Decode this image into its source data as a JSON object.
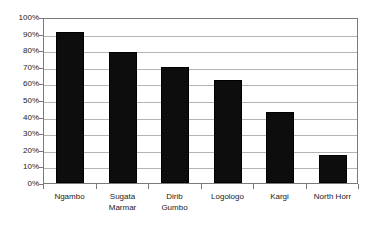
{
  "chart_data": {
    "type": "bar",
    "title": "",
    "subtitle": "",
    "xlabel": "",
    "ylabel": "",
    "ylim": [
      0,
      100
    ],
    "yunit": "%",
    "grid": true,
    "legend": false,
    "legend_position": "none",
    "orientation": "vertical",
    "bar_color": "#0d0d0d",
    "gridline_color": "#b4b4b4",
    "frame_color": "#7a7a7a",
    "background_color": "#ffffff",
    "categories": [
      "Ngambo",
      "Sugata Marmar",
      "Dirib Gumbo",
      "Logologo",
      "Kargi",
      "North Horr"
    ],
    "category_lines": [
      [
        "Ngambo"
      ],
      [
        "Sugata",
        "Marmar"
      ],
      [
        "Dirib",
        "Gumbo"
      ],
      [
        "Logologo"
      ],
      [
        "Kargi"
      ],
      [
        "North Horr"
      ]
    ],
    "values": [
      91,
      79,
      70,
      62,
      43,
      17
    ],
    "value_labels": [
      "91%",
      "79%",
      "70%",
      "62%",
      "43%",
      "17%"
    ],
    "ytick_values": [
      100,
      90,
      80,
      70,
      60,
      50,
      40,
      30,
      20,
      10,
      0
    ],
    "ytick_labels": [
      "100%",
      "90%",
      "80%",
      "70%",
      "60%",
      "50%",
      "40%",
      "30%",
      "20%",
      "10%",
      "0%"
    ]
  }
}
